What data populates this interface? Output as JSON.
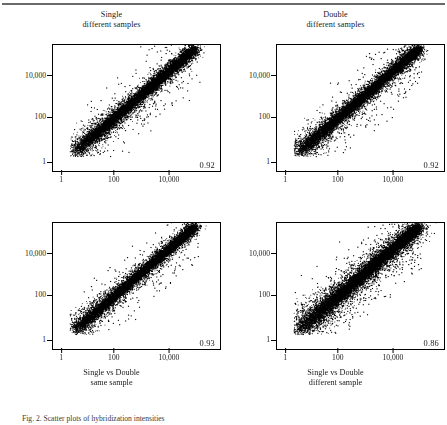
{
  "figure": {
    "caption_fragment": "Fig. 2. Scatter plots of hybridization intensities",
    "axis_tick_color": "#000000",
    "point_color": "#000000"
  },
  "chart_data": [
    {
      "type": "scatter",
      "id": "single-different-samples",
      "title": "Single",
      "subtitle": "different samples",
      "correlation": "0.92",
      "correlation_value": 0.92,
      "xlabel": "",
      "ylabel": "",
      "xscale": "log",
      "yscale": "log",
      "xticks": [
        "1",
        "100",
        "10,000"
      ],
      "yticks": [
        "10,000",
        "100",
        "1"
      ],
      "xlim": [
        1,
        1000000
      ],
      "ylim": [
        1,
        1000000
      ],
      "grid": false,
      "legend": "none",
      "n_points": 4200,
      "spread": 0.165,
      "outlier_fraction": 0.055,
      "annotation_position": "bottom-right"
    },
    {
      "type": "scatter",
      "id": "double-different-samples",
      "title": "Double",
      "subtitle": "different samples",
      "correlation": "0.92",
      "correlation_value": 0.92,
      "xlabel": "",
      "ylabel": "",
      "xscale": "log",
      "yscale": "log",
      "xticks": [
        "1",
        "100",
        "10,000"
      ],
      "yticks": [
        "10,000",
        "100",
        "1"
      ],
      "xlim": [
        1,
        1000000
      ],
      "ylim": [
        1,
        1000000
      ],
      "grid": false,
      "legend": "none",
      "n_points": 4200,
      "spread": 0.17,
      "outlier_fraction": 0.06,
      "annotation_position": "bottom-right"
    },
    {
      "type": "scatter",
      "id": "single-vs-double-same-sample",
      "title": "Single vs Double",
      "subtitle": "same sample",
      "correlation": "0.93",
      "correlation_value": 0.93,
      "xlabel": "",
      "ylabel": "",
      "xscale": "log",
      "yscale": "log",
      "xticks": [
        "1",
        "100",
        "10,000"
      ],
      "yticks": [
        "10,000",
        "100",
        "1"
      ],
      "xlim": [
        1,
        1000000
      ],
      "ylim": [
        1,
        1000000
      ],
      "grid": false,
      "legend": "none",
      "n_points": 4200,
      "spread": 0.15,
      "outlier_fraction": 0.05,
      "annotation_position": "bottom-right"
    },
    {
      "type": "scatter",
      "id": "single-vs-double-different-sample",
      "title": "Single vs Double",
      "subtitle": "different sample",
      "correlation": "0.86",
      "correlation_value": 0.86,
      "xlabel": "",
      "ylabel": "",
      "xscale": "log",
      "yscale": "log",
      "xticks": [
        "1",
        "100",
        "10,000"
      ],
      "yticks": [
        "10,000",
        "100",
        "1"
      ],
      "xlim": [
        1,
        1000000
      ],
      "ylim": [
        1,
        1000000
      ],
      "grid": false,
      "legend": "none",
      "n_points": 4200,
      "spread": 0.235,
      "outlier_fraction": 0.095,
      "annotation_position": "bottom-right"
    }
  ],
  "panels": {
    "top_left": {
      "title_line1": "Single",
      "title_line2": "different samples",
      "correlation": "0.92",
      "yticks": [
        {
          "label": "10,000",
          "pos": 0.25
        },
        {
          "label": "100",
          "pos": 0.58
        },
        {
          "label": "1",
          "pos": 0.94
        }
      ],
      "xticks": [
        {
          "label": "1",
          "pos": 0.055
        },
        {
          "label": "100",
          "pos": 0.37
        },
        {
          "label": "10,000",
          "pos": 0.7
        }
      ]
    },
    "top_right": {
      "title_line1": "Double",
      "title_line2": "different samples",
      "correlation": "0.92",
      "yticks": [
        {
          "label": "10,000",
          "pos": 0.25
        },
        {
          "label": "100",
          "pos": 0.58
        },
        {
          "label": "1",
          "pos": 0.94
        }
      ],
      "xticks": [
        {
          "label": "1",
          "pos": 0.055
        },
        {
          "label": "100",
          "pos": 0.37
        },
        {
          "label": "10,000",
          "pos": 0.7
        }
      ]
    },
    "bottom_left": {
      "caption_line1": "Single vs Double",
      "caption_line2": "same sample",
      "correlation": "0.93",
      "yticks": [
        {
          "label": "10,000",
          "pos": 0.25
        },
        {
          "label": "100",
          "pos": 0.58
        },
        {
          "label": "1",
          "pos": 0.94
        }
      ],
      "xticks": [
        {
          "label": "1",
          "pos": 0.055
        },
        {
          "label": "100",
          "pos": 0.37
        },
        {
          "label": "10,000",
          "pos": 0.7
        }
      ]
    },
    "bottom_right": {
      "caption_line1": "Single vs Double",
      "caption_line2": "different sample",
      "correlation": "0.86",
      "yticks": [
        {
          "label": "10,000",
          "pos": 0.25
        },
        {
          "label": "100",
          "pos": 0.58
        },
        {
          "label": "1",
          "pos": 0.94
        }
      ],
      "xticks": [
        {
          "label": "1",
          "pos": 0.055
        },
        {
          "label": "100",
          "pos": 0.37
        },
        {
          "label": "10,000",
          "pos": 0.7
        }
      ]
    }
  }
}
